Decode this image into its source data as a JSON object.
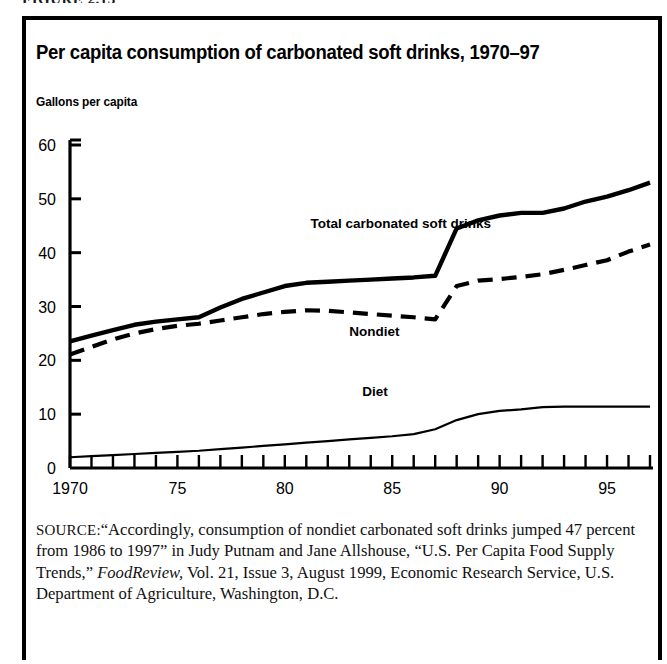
{
  "figure": {
    "label": "FIGURE 2.13"
  },
  "header": {
    "title": "Per capita consumption of carbonated soft drinks, 1970–97",
    "axis_title": "Gallons per capita"
  },
  "source": {
    "prefix": "SOURCE:",
    "part1": "“Accordingly, consumption of nondiet carbonated soft drinks jumped 47 percent from 1986 to 1997” in Judy Putnam and Jane Allshouse, “U.S. Per Capita Food Supply Trends,” ",
    "italic": "FoodReview,",
    "part2": " Vol. 21, Issue 3, August 1999, Economic Research Service, U.S. Department of Agriculture, Washington, D.C."
  },
  "colors": {
    "ink": "#000000",
    "background": "#ffffff"
  },
  "chart_data": {
    "type": "line",
    "title": "Per capita consumption of carbonated soft drinks, 1970–97",
    "xlabel": "",
    "ylabel": "Gallons per capita",
    "xlim": [
      1970,
      1997
    ],
    "ylim": [
      0,
      60
    ],
    "ytick_labels": [
      "0",
      "10",
      "20",
      "30",
      "40",
      "50",
      "60"
    ],
    "yticks": [
      0,
      10,
      20,
      30,
      40,
      50,
      60
    ],
    "xtick_labels": [
      "1970",
      "75",
      "80",
      "85",
      "90",
      "95"
    ],
    "xticks": [
      1970,
      1975,
      1980,
      1985,
      1990,
      1995
    ],
    "minor_xticks_every": 1,
    "grid": false,
    "legend": "inline-labels",
    "x": [
      1970,
      1971,
      1972,
      1973,
      1974,
      1975,
      1976,
      1977,
      1978,
      1979,
      1980,
      1981,
      1982,
      1983,
      1984,
      1985,
      1986,
      1987,
      1988,
      1989,
      1990,
      1991,
      1992,
      1993,
      1994,
      1995,
      1996,
      1997
    ],
    "series": [
      {
        "name": "Total carbonated soft drinks",
        "style": "solid-thick",
        "label_x": 1981.2,
        "label_y": 44.5,
        "values": [
          23.5,
          24.6,
          25.6,
          26.6,
          27.2,
          27.6,
          28.0,
          29.8,
          31.4,
          32.6,
          33.8,
          34.4,
          34.6,
          34.8,
          35.0,
          35.2,
          35.4,
          35.7,
          44.5,
          46.0,
          46.9,
          47.4,
          47.4,
          48.2,
          49.5,
          50.4,
          51.6,
          53.0
        ]
      },
      {
        "name": "Nondiet",
        "style": "dashed",
        "label_x": 1983.0,
        "label_y": 24.5,
        "values": [
          21.1,
          22.5,
          23.9,
          25.0,
          25.8,
          26.4,
          26.8,
          27.4,
          28.0,
          28.6,
          29.0,
          29.3,
          29.2,
          28.9,
          28.6,
          28.3,
          28.0,
          27.6,
          33.8,
          34.8,
          35.1,
          35.5,
          36.0,
          36.8,
          37.7,
          38.6,
          40.2,
          41.5
        ]
      },
      {
        "name": "Diet",
        "style": "solid-thin",
        "label_x": 1983.6,
        "label_y": 13.4,
        "values": [
          2.0,
          2.2,
          2.4,
          2.6,
          2.8,
          3.0,
          3.2,
          3.5,
          3.8,
          4.1,
          4.4,
          4.7,
          5.0,
          5.3,
          5.6,
          5.9,
          6.3,
          7.2,
          8.9,
          10.0,
          10.6,
          10.9,
          11.3,
          11.4,
          11.4,
          11.4,
          11.4,
          11.4
        ]
      }
    ]
  }
}
